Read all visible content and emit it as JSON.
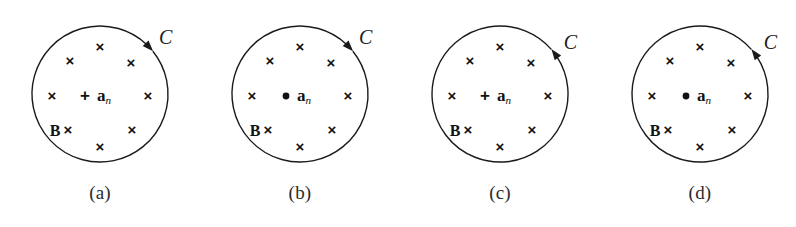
{
  "figure": {
    "background_color": "#ffffff",
    "stroke_color": "#1a1a1a",
    "panel_count": 4,
    "field_symbol": "×",
    "field_label": "B",
    "contour_label": "C",
    "normal_vector_symbol": "a",
    "normal_vector_subscript": "n",
    "into_page_marker": "+",
    "out_of_page_marker": "•"
  },
  "panels": [
    {
      "id": "panel-a",
      "caption": "(a)",
      "contour_label": "C",
      "orientation": "clockwise",
      "center_marker": "+",
      "center_marker_name": "plus-marker",
      "normal_vector": "a",
      "normal_subscript": "n",
      "field_label": "B",
      "cross_count": 8
    },
    {
      "id": "panel-b",
      "caption": "(b)",
      "contour_label": "C",
      "orientation": "clockwise",
      "center_marker": "•",
      "center_marker_name": "dot-marker",
      "normal_vector": "a",
      "normal_subscript": "n",
      "field_label": "B",
      "cross_count": 8
    },
    {
      "id": "panel-c",
      "caption": "(c)",
      "contour_label": "C",
      "orientation": "counterclockwise",
      "center_marker": "+",
      "center_marker_name": "plus-marker",
      "normal_vector": "a",
      "normal_subscript": "n",
      "field_label": "B",
      "cross_count": 8
    },
    {
      "id": "panel-d",
      "caption": "(d)",
      "contour_label": "C",
      "orientation": "counterclockwise",
      "center_marker": "•",
      "center_marker_name": "dot-marker",
      "normal_vector": "a",
      "normal_subscript": "n",
      "field_label": "B",
      "cross_count": 8
    }
  ],
  "cross_positions": [
    {
      "x": 100,
      "y": 48
    },
    {
      "x": 70,
      "y": 62
    },
    {
      "x": 131,
      "y": 64
    },
    {
      "x": 52,
      "y": 97
    },
    {
      "x": 148,
      "y": 97
    },
    {
      "x": 68,
      "y": 131
    },
    {
      "x": 132,
      "y": 131
    },
    {
      "x": 100,
      "y": 148
    }
  ],
  "geometry": {
    "circle_cx": 100,
    "circle_cy": 94,
    "circle_r": 68,
    "panel_width": 200,
    "caption_y": 182
  }
}
